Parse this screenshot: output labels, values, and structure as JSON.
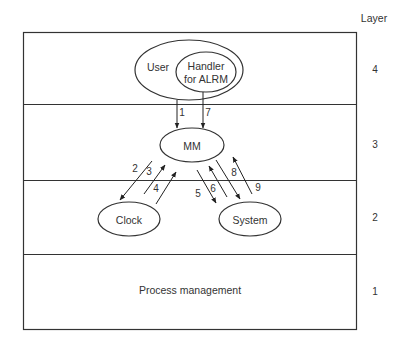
{
  "title": "Layer",
  "layers": [
    {
      "id": 4,
      "label": "4"
    },
    {
      "id": 3,
      "label": "3"
    },
    {
      "id": 2,
      "label": "2"
    },
    {
      "id": 1,
      "label": "1"
    }
  ],
  "nodes": {
    "user": "User",
    "handler_line1": "Handler",
    "handler_line2": "for ALRM",
    "mm": "MM",
    "clock": "Clock",
    "system": "System",
    "process_management": "Process management"
  },
  "arrows": [
    {
      "id": "1",
      "from": "User",
      "to": "MM"
    },
    {
      "id": "2",
      "from": "MM",
      "to": "Clock"
    },
    {
      "id": "3",
      "from": "Clock",
      "to": "MM"
    },
    {
      "id": "4",
      "from": "Clock",
      "to": "MM"
    },
    {
      "id": "5",
      "from": "MM",
      "to": "System"
    },
    {
      "id": "6",
      "from": "System",
      "to": "MM"
    },
    {
      "id": "7",
      "from": "Handler for ALRM",
      "to": "MM"
    },
    {
      "id": "8",
      "from": "MM",
      "to": "System"
    },
    {
      "id": "9",
      "from": "System",
      "to": "MM"
    }
  ],
  "colors": {
    "stroke": "#333333",
    "background": "#ffffff"
  }
}
